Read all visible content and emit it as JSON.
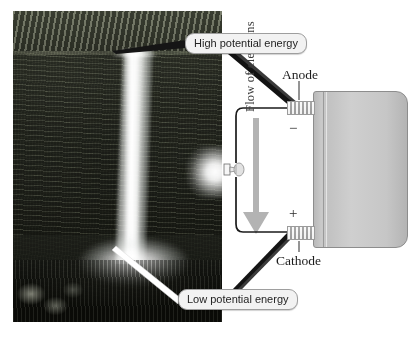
{
  "figure": {
    "type": "diagram",
    "background_color": "#ffffff"
  },
  "photo": {
    "name": "waterfall-photograph",
    "description": "Black and white photograph of a tall waterfall plunging into a misty pool surrounded by forest"
  },
  "callouts": [
    {
      "id": "high",
      "label": "High potential energy"
    },
    {
      "id": "low",
      "label": "Low potential energy"
    }
  ],
  "battery": {
    "name": "battery",
    "color": "#c6c6c6",
    "terminals": [
      {
        "id": "anode",
        "label": "Anode",
        "sign": "−"
      },
      {
        "id": "cathode",
        "label": "Cathode",
        "sign": "+"
      }
    ]
  },
  "circuit": {
    "flow_label": "Flow of electrons",
    "arrow_color": "#b0b0b0",
    "wire_color": "#1e1e1e",
    "bulb": {
      "name": "light-bulb",
      "state": "lit"
    }
  },
  "labels": {
    "anode": "Anode",
    "cathode": "Cathode",
    "minus_sign": "−",
    "plus_sign": "+",
    "flow_of_electrons": "Flow of electrons",
    "high_potential_energy": "High potential energy",
    "low_potential_energy": "Low potential energy"
  }
}
